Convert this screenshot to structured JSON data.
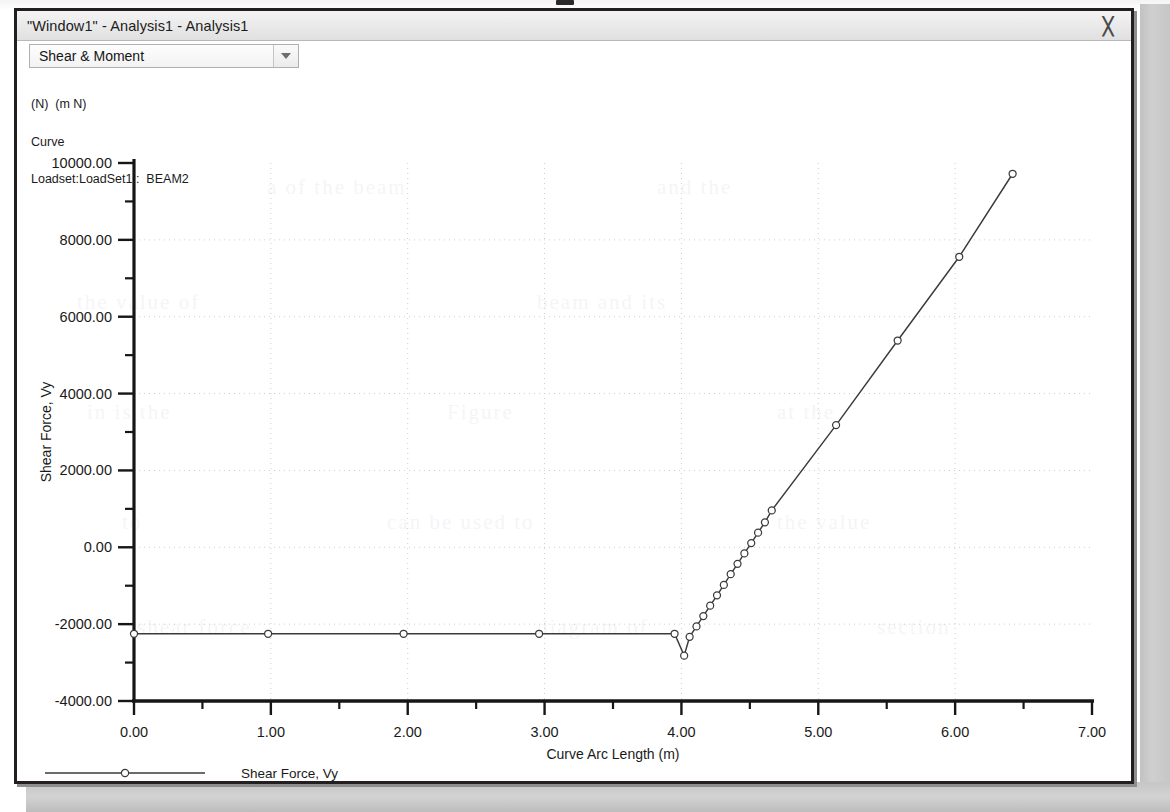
{
  "window": {
    "title": "\"Window1\" - Analysis1 - Analysis1",
    "close_glyph": "╳"
  },
  "toolbar": {
    "mode_selector_value": "Shear & Moment",
    "mode_selector_options": [
      "Shear & Moment"
    ],
    "dropdown_arrow": "chevron-down-icon"
  },
  "plot_header": {
    "units_line": "(N)  (m N)",
    "curve_line": "Curve",
    "loadset_line": "Loadset:LoadSet1 :  BEAM2"
  },
  "legend": {
    "entries": [
      {
        "label": "Shear Force, Vy",
        "color": "#3a3a3a",
        "marker": "circle"
      }
    ]
  },
  "colors": {
    "line": "#3a3a3a",
    "axis": "#161616",
    "grid": "#cfcfcf",
    "text": "#1a1a1a",
    "plot_background": "#ffffff",
    "window_border": "#231f20",
    "desktop": "#c9c9c9"
  },
  "ghost_text": [
    {
      "text": "a of the beam",
      "x": 250,
      "y": 60
    },
    {
      "text": "and the",
      "x": 640,
      "y": 60
    },
    {
      "text": "the value of",
      "x": 60,
      "y": 175
    },
    {
      "text": "beam and its",
      "x": 520,
      "y": 175
    },
    {
      "text": "in is the",
      "x": 70,
      "y": 285
    },
    {
      "text": "Figure",
      "x": 430,
      "y": 285
    },
    {
      "text": "at the",
      "x": 760,
      "y": 285
    },
    {
      "text": "to",
      "x": 105,
      "y": 395
    },
    {
      "text": "can be used to",
      "x": 370,
      "y": 395
    },
    {
      "text": "the value",
      "x": 760,
      "y": 395
    },
    {
      "text": "shear force",
      "x": 120,
      "y": 500
    },
    {
      "text": "diagram of",
      "x": 520,
      "y": 500
    },
    {
      "text": "section",
      "x": 860,
      "y": 500
    }
  ],
  "chart_data": {
    "type": "line",
    "title": "",
    "xlabel": "Curve Arc Length (m)",
    "ylabel": "Shear Force, Vy",
    "xlim": [
      0.0,
      7.0
    ],
    "ylim": [
      -4000.0,
      10000.0
    ],
    "xticks": [
      0.0,
      1.0,
      2.0,
      3.0,
      4.0,
      5.0,
      6.0,
      7.0
    ],
    "xtick_labels": [
      "0.00",
      "1.00",
      "2.00",
      "3.00",
      "4.00",
      "5.00",
      "6.00",
      "7.00"
    ],
    "yticks": [
      -4000,
      -2000,
      0,
      2000,
      4000,
      6000,
      8000,
      10000
    ],
    "ytick_labels": [
      "-4000.00",
      "-2000.00",
      "0.00",
      "2000.00",
      "4000.00",
      "6000.00",
      "8000.00",
      "10000.00"
    ],
    "xminor_step": 0.5,
    "yminor_step": 1000,
    "grid": true,
    "grid_style": "dotted",
    "legend_position": "bottom-left",
    "marker": "open-circle",
    "series": [
      {
        "name": "Shear Force, Vy",
        "color": "#3a3a3a",
        "x": [
          0.0,
          0.98,
          1.97,
          2.96,
          3.95,
          4.02,
          4.06,
          4.11,
          4.16,
          4.21,
          4.26,
          4.31,
          4.36,
          4.41,
          4.46,
          4.51,
          4.56,
          4.61,
          4.66,
          5.13,
          5.58,
          6.03,
          6.42
        ],
        "y": [
          -2250,
          -2250,
          -2250,
          -2250,
          -2250,
          -2820,
          -2330,
          -2060,
          -1790,
          -1520,
          -1250,
          -980,
          -700,
          -430,
          -160,
          110,
          380,
          650,
          960,
          3180,
          5380,
          7560,
          9720
        ]
      }
    ]
  }
}
